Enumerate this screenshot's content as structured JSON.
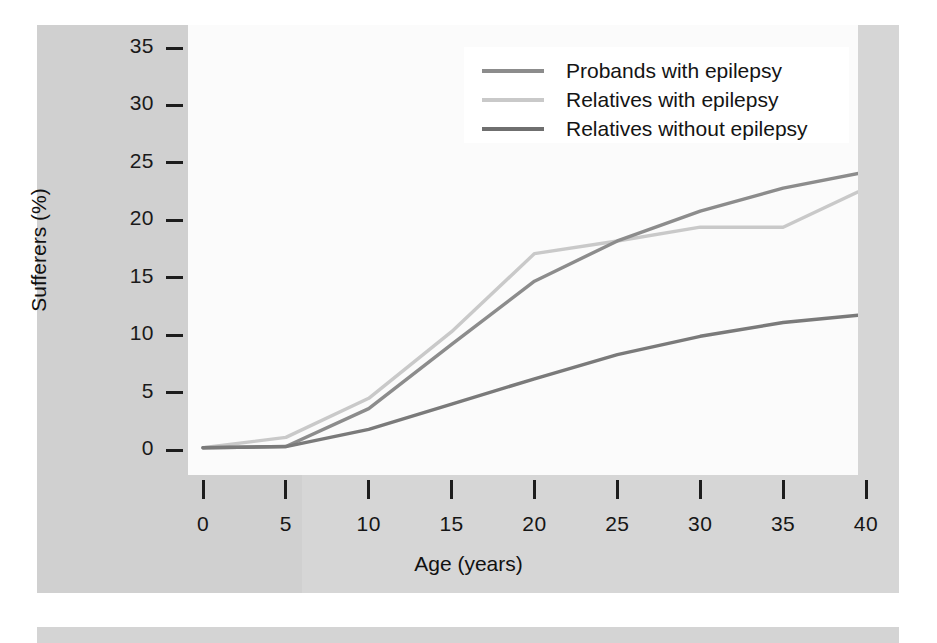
{
  "figure": {
    "background_color": "#d0d0d0",
    "plot_background_color": "#fbfbfb"
  },
  "chart_data": {
    "type": "line",
    "title": "",
    "subtitle": "",
    "xlabel": "Age (years)",
    "ylabel": "Sufferers (%)",
    "x": [
      0,
      5,
      10,
      15,
      20,
      25,
      30,
      35,
      40
    ],
    "xlim": [
      0,
      40
    ],
    "ylim": [
      0,
      35
    ],
    "xticks": [
      0,
      5,
      10,
      15,
      20,
      25,
      30,
      35,
      40
    ],
    "yticks": [
      0,
      5,
      10,
      15,
      20,
      25,
      30,
      35
    ],
    "xtick_labels": [
      "0",
      "5",
      "10",
      "15",
      "20",
      "25",
      "30",
      "35",
      "40"
    ],
    "ytick_labels": [
      "0",
      "5",
      "10",
      "15",
      "20",
      "25",
      "30",
      "35"
    ],
    "grid": false,
    "legend_position": "top-right",
    "series": [
      {
        "name": "Probands with epilepsy",
        "color": "#8c8c8c",
        "values": [
          0.2,
          0.3,
          3.6,
          9.2,
          14.7,
          18.2,
          20.8,
          22.8,
          24.2
        ]
      },
      {
        "name": "Relatives with epilepsy",
        "color": "#c9c9c9",
        "values": [
          0.2,
          1.1,
          4.5,
          10.3,
          17.1,
          18.2,
          19.4,
          19.4,
          22.8
        ]
      },
      {
        "name": "Relatives without epilepsy",
        "color": "#7a7a7a",
        "values": [
          0.2,
          0.3,
          1.8,
          4.0,
          6.2,
          8.3,
          9.9,
          11.1,
          11.8
        ]
      }
    ]
  },
  "legend": {
    "items": [
      {
        "label": "Probands with epilepsy",
        "color": "#8c8c8c"
      },
      {
        "label": "Relatives with epilepsy",
        "color": "#c9c9c9"
      },
      {
        "label": "Relatives without epilepsy",
        "color": "#6f6f6f"
      }
    ]
  }
}
